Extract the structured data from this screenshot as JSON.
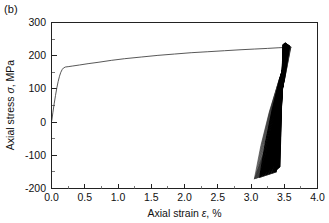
{
  "figure": {
    "panel_label": "(b)"
  },
  "chart_data": {
    "type": "line",
    "title": "",
    "subtitle": "",
    "xlabel_prefix": "Axial strain ",
    "xlabel_symbol": "ε",
    "xlabel_suffix": ", %",
    "xlabel": "Axial strain ε, %",
    "ylabel_prefix": "Axial stress ",
    "ylabel_symbol": "σ",
    "ylabel_suffix": ", MPa",
    "ylabel": "Axial stress σ, MPa",
    "xlim": [
      0.0,
      4.0
    ],
    "ylim": [
      -200,
      300
    ],
    "x_ticks": [
      0.0,
      0.5,
      1.0,
      1.5,
      2.0,
      2.5,
      3.0,
      3.5,
      4.0
    ],
    "x_tick_labels": [
      "0.0",
      "0.5",
      "1.0",
      "1.5",
      "2.0",
      "2.5",
      "3.0",
      "3.5",
      "4.0"
    ],
    "x_minor_ticks": [
      0.25,
      0.75,
      1.25,
      1.75,
      2.25,
      2.75,
      3.25,
      3.75
    ],
    "y_ticks": [
      -200,
      -100,
      0,
      100,
      200,
      300
    ],
    "y_tick_labels": [
      "-200",
      "-100",
      "0",
      "100",
      "200",
      "300"
    ],
    "y_minor_ticks": [
      -150,
      -50,
      50,
      150,
      250
    ],
    "grid": false,
    "legend": false,
    "legend_position": "none",
    "series": [
      {
        "name": "monotonic-loading-curve",
        "color": "#3a3a3a",
        "description": "Initial elastic rise to yield then gradual strain hardening up to the cyclic block",
        "points": [
          [
            0.005,
            5
          ],
          [
            0.02,
            28
          ],
          [
            0.04,
            55
          ],
          [
            0.06,
            80
          ],
          [
            0.08,
            103
          ],
          [
            0.1,
            122
          ],
          [
            0.12,
            138
          ],
          [
            0.14,
            150
          ],
          [
            0.16,
            158
          ],
          [
            0.18,
            163
          ],
          [
            0.21,
            166
          ],
          [
            0.25,
            167
          ],
          [
            0.32,
            169
          ],
          [
            0.42,
            172
          ],
          [
            0.55,
            176
          ],
          [
            0.7,
            180
          ],
          [
            0.9,
            186
          ],
          [
            1.1,
            191
          ],
          [
            1.35,
            196
          ],
          [
            1.6,
            201
          ],
          [
            1.85,
            205
          ],
          [
            2.1,
            209
          ],
          [
            2.35,
            212
          ],
          [
            2.6,
            215
          ],
          [
            2.85,
            218
          ],
          [
            3.05,
            220
          ],
          [
            3.25,
            222
          ],
          [
            3.42,
            224
          ],
          [
            3.55,
            225
          ],
          [
            3.6,
            225
          ]
        ]
      },
      {
        "name": "cyclic-hysteresis-loops",
        "color": "#000000",
        "description": "Dense bundle of near-vertical hysteresis loops accumulated at about 3.0 to 3.6 percent strain",
        "strain_range": [
          3.05,
          3.6
        ],
        "stress_range": [
          -172,
          240
        ],
        "peak_tensile_stress": 240,
        "peak_compressive_stress": -172,
        "loop_count_visible": 30
      }
    ],
    "annotations": [
      {
        "text": "(b)",
        "position": "outside-top-left"
      }
    ]
  }
}
